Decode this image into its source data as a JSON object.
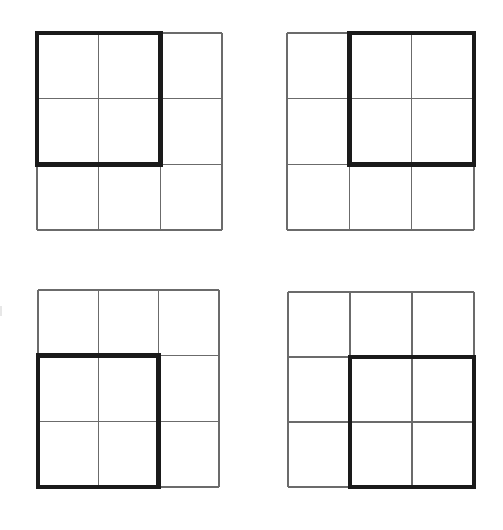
{
  "figure": {
    "canvas_width": 503,
    "canvas_height": 530,
    "background_color": "#ffffff",
    "thin_line_color": "#6b6b6b",
    "bold_line_color": "#1a1a1a",
    "thin_line_width": 1.4,
    "bold_line_width": 4.4,
    "grid_rows": 3,
    "grid_cols": 3,
    "panel_count": 4
  },
  "panels": [
    {
      "id": "panel-top-left",
      "label": "Top-left panel",
      "position": "top-left",
      "x": 37,
      "y": 33,
      "width": 185,
      "height": 197,
      "highlight": {
        "name": "bold-2x2-square",
        "corner": "top-left",
        "row_start": 1,
        "row_end": 2,
        "col_start": 1,
        "col_end": 2
      }
    },
    {
      "id": "panel-top-right",
      "label": "Top-right panel",
      "position": "top-right",
      "x": 287,
      "y": 33,
      "width": 187,
      "height": 197,
      "highlight": {
        "name": "bold-2x2-square",
        "corner": "top-right",
        "row_start": 1,
        "row_end": 2,
        "col_start": 2,
        "col_end": 3
      }
    },
    {
      "id": "panel-bottom-left",
      "label": "Bottom-left panel",
      "position": "bottom-left",
      "x": 38,
      "y": 290,
      "width": 181,
      "height": 197,
      "highlight": {
        "name": "bold-2x2-square",
        "corner": "bottom-left",
        "row_start": 2,
        "row_end": 3,
        "col_start": 1,
        "col_end": 2
      }
    },
    {
      "id": "panel-bottom-right",
      "label": "Bottom-right panel",
      "position": "bottom-right",
      "x": 288,
      "y": 292,
      "width": 186,
      "height": 195,
      "highlight": {
        "name": "bold-2x2-square",
        "corner": "bottom-right",
        "row_start": 2,
        "row_end": 3,
        "col_start": 2,
        "col_end": 3
      }
    }
  ],
  "artifact": {
    "name": "left-edge-scan-artifact",
    "x": 0,
    "y": 306,
    "width": 2,
    "height": 10,
    "color": "#e7e7e7"
  }
}
